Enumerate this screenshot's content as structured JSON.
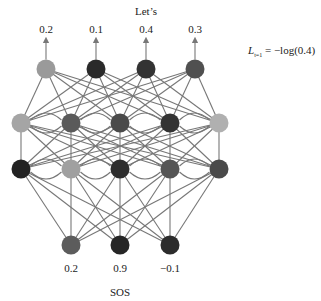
{
  "title": "Let’s",
  "output_probs": [
    "0.2",
    "0.1",
    "0.4",
    "0.3"
  ],
  "input_values": [
    "0.2",
    "0.9",
    "−0.1"
  ],
  "input_token": "SOS",
  "loss": {
    "symbol": "L",
    "subscript": "t=1",
    "expr": " = −log(0.4)"
  },
  "layers": {
    "output": {
      "y": 69,
      "x": [
        46,
        96,
        146,
        195
      ],
      "colors": [
        "#9a9a9a",
        "#2a2a2a",
        "#333333",
        "#505050"
      ]
    },
    "hidden_top": {
      "y": 123,
      "x": [
        21,
        71,
        120,
        170,
        219
      ],
      "colors": [
        "#a5a5a5",
        "#5a5a5a",
        "#4a4a4a",
        "#333333",
        "#b0b0b0"
      ]
    },
    "hidden_bottom": {
      "y": 169,
      "x": [
        21,
        71,
        120,
        170,
        219
      ],
      "colors": [
        "#222222",
        "#a0a0a0",
        "#2e2e2e",
        "#555555",
        "#4a4a4a"
      ]
    },
    "input": {
      "y": 245,
      "x": [
        71,
        120,
        170
      ],
      "colors": [
        "#5c5c5c",
        "#262626",
        "#2c2c2c"
      ]
    }
  },
  "colors": {
    "edge": "#777777"
  }
}
